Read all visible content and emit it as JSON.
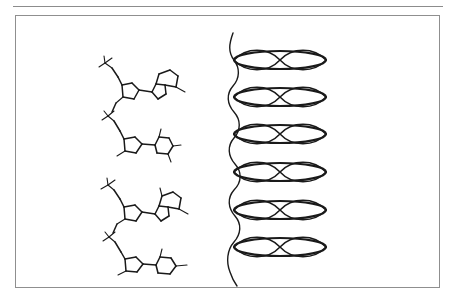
{
  "figure": {
    "kind": "scanned-scientific-illustration",
    "caption_present": false,
    "panels": [
      {
        "name": "chemical-structures-panel",
        "position": "left",
        "description": "Two stacked DNA dinucleotide skeletal structures",
        "structures": [
          {
            "label": "upper-dinucleotide",
            "nucleotides": [
              {
                "sugar": "deoxyribose-furanose-ring",
                "base": "purine-bicyclic-base",
                "phosphate": "phosphate-group"
              },
              {
                "sugar": "deoxyribose-furanose-ring",
                "base": "pyrimidine-six-ring-base",
                "phosphate": "phosphate-group"
              }
            ]
          },
          {
            "label": "lower-dinucleotide",
            "nucleotides": [
              {
                "sugar": "deoxyribose-furanose-ring",
                "base": "purine-bicyclic-base",
                "phosphate": "phosphate-group"
              },
              {
                "sugar": "deoxyribose-furanose-ring",
                "base": "pyrimidine-six-ring-base",
                "phosphate": "phosphate-group"
              }
            ]
          }
        ]
      },
      {
        "name": "helix-panel",
        "position": "right",
        "description": "Vertical wavy helix backbone with stacked elliptical base-pair disks",
        "disk_count": 6,
        "disk_centers_y": [
          60,
          97,
          134,
          172,
          210,
          247
        ],
        "disk_center_x": 280,
        "disk_width": 92,
        "disk_height": 18,
        "backbone_top_y": 33,
        "backbone_bottom_y": 286,
        "backbone_x": 232
      }
    ],
    "colors": {
      "ink": "#1a1a1a",
      "border": "#8f8f8f",
      "rule": "#8c8c8c",
      "background": "#ffffff"
    }
  }
}
